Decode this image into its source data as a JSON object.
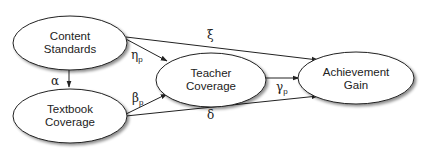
{
  "diagram": {
    "nodes": [
      {
        "id": "content_standards",
        "line1": "Content",
        "line2": "Standards"
      },
      {
        "id": "textbook_coverage",
        "line1": "Textbook",
        "line2": "Coverage"
      },
      {
        "id": "teacher_coverage",
        "line1": "Teacher",
        "line2": "Coverage"
      },
      {
        "id": "achievement_gain",
        "line1": "Achievement",
        "line2": "Gain"
      }
    ],
    "edges": [
      {
        "from": "content_standards",
        "to": "textbook_coverage",
        "label": "α",
        "sub": ""
      },
      {
        "from": "content_standards",
        "to": "teacher_coverage",
        "label": "η",
        "sub": "p"
      },
      {
        "from": "content_standards",
        "to": "achievement_gain",
        "label": "ξ",
        "sub": ""
      },
      {
        "from": "textbook_coverage",
        "to": "teacher_coverage",
        "label": "β",
        "sub": "p"
      },
      {
        "from": "textbook_coverage",
        "to": "achievement_gain",
        "label": "δ",
        "sub": ""
      },
      {
        "from": "teacher_coverage",
        "to": "achievement_gain",
        "label": "γ",
        "sub": "p"
      }
    ]
  }
}
